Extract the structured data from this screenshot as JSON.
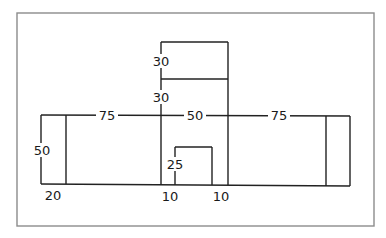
{
  "diagram": {
    "type": "floor-plan-dimensions",
    "colors": {
      "line": "#222222",
      "frame": "#8c8c8c",
      "text": "#1a1a1a",
      "background": "#ffffff"
    },
    "labels": {
      "top_left_span": "75",
      "top_middle_span": "50",
      "top_right_span": "75",
      "left_height": "50",
      "left_width": "20",
      "tower_upper_height": "30",
      "tower_lower_height": "30",
      "inner_notch_height": "25",
      "inner_notch_left_offset": "10",
      "inner_notch_right_offset": "10"
    }
  }
}
